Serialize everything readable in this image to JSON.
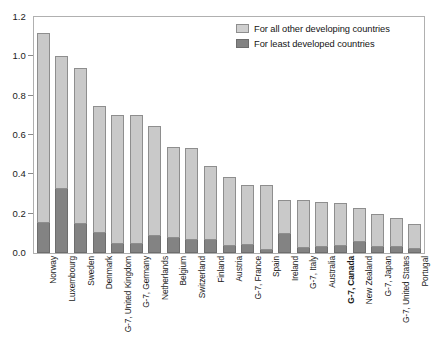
{
  "chart_data": {
    "type": "bar",
    "title": "",
    "subtitle": "",
    "xlabel": "",
    "ylabel": "",
    "stacked": true,
    "grid": false,
    "legend_position": "top-right",
    "ylim": [
      0,
      1.2
    ],
    "ytick_values": [
      0.0,
      0.2,
      0.4,
      0.6,
      0.8,
      1.0,
      1.2
    ],
    "ytick_labels": [
      "0.0",
      "0.2",
      "0.4",
      "0.6",
      "0.8",
      "1.0",
      "1.2"
    ],
    "categories": [
      "Norway",
      "Luxembourg",
      "Sweden",
      "Denmark",
      "G-7, United Kingdom",
      "G-7, Germany",
      "Netherlands",
      "Belgium",
      "Switzerland",
      "Finland",
      "Austria",
      "G-7, France",
      "Spain",
      "Ireland",
      "G-7, Italy",
      "Australia",
      "G-7, Canada",
      "New Zealand",
      "G-7, Japan",
      "G-7, United States",
      "Portugal"
    ],
    "highlighted_categories": [
      "G-7, Canada"
    ],
    "series": [
      {
        "name": "For least developed countries",
        "color": "#838383",
        "values": [
          0.16,
          0.33,
          0.155,
          0.105,
          0.05,
          0.05,
          0.09,
          0.08,
          0.07,
          0.07,
          0.04,
          0.045,
          0.02,
          0.1,
          0.03,
          0.035,
          0.04,
          0.06,
          0.035,
          0.035,
          0.025
        ]
      },
      {
        "name": "For all other developing countries",
        "color": "#c9c9c9",
        "values": [
          0.96,
          0.67,
          0.785,
          0.645,
          0.65,
          0.65,
          0.555,
          0.46,
          0.465,
          0.37,
          0.345,
          0.3,
          0.325,
          0.17,
          0.24,
          0.225,
          0.215,
          0.17,
          0.165,
          0.145,
          0.125
        ]
      }
    ],
    "totals": [
      1.12,
      1.0,
      0.94,
      0.75,
      0.7,
      0.7,
      0.645,
      0.54,
      0.535,
      0.44,
      0.385,
      0.345,
      0.345,
      0.27,
      0.27,
      0.26,
      0.255,
      0.23,
      0.2,
      0.18,
      0.15
    ]
  },
  "legend": {
    "items": [
      {
        "label": "For all other developing countries",
        "style": "other"
      },
      {
        "label": "For least developed countries",
        "style": "least"
      }
    ]
  },
  "colors": {
    "other_developing": "#c9c9c9",
    "least_developed": "#838383",
    "axis": "#b0b0b0",
    "text": "#1a1a1a",
    "background": "#ffffff"
  }
}
